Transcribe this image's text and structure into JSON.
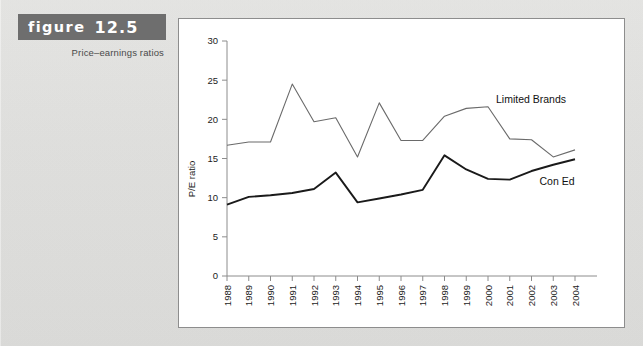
{
  "figure": {
    "label_word": "figure",
    "label_number": "12.5",
    "subtitle": "Price–earnings ratios",
    "banner_color": "#6e6e6e"
  },
  "chart_data": {
    "type": "line",
    "title": "",
    "xlabel": "",
    "ylabel": "P/E ratio",
    "ylim": [
      0,
      30
    ],
    "yticks": [
      0,
      5,
      10,
      15,
      20,
      25,
      30
    ],
    "ytick_labels": [
      "0",
      "5",
      "10",
      "15",
      "20",
      "25",
      "30"
    ],
    "grid": false,
    "legend_position": "inline-right",
    "categories": [
      "1988",
      "1989",
      "1990",
      "1991",
      "1992",
      "1993",
      "1994",
      "1995",
      "1996",
      "1997",
      "1998",
      "1999",
      "2000",
      "2001",
      "2002",
      "2003",
      "2004"
    ],
    "series": [
      {
        "name": "Limited Brands",
        "color": "#6a6a6a",
        "values": [
          16.7,
          17.1,
          17.1,
          24.5,
          19.7,
          20.2,
          15.2,
          22.1,
          17.3,
          17.3,
          20.4,
          21.4,
          21.6,
          17.5,
          17.4,
          15.2,
          16.1
        ]
      },
      {
        "name": "Con Ed",
        "color": "#1a1a1a",
        "values": [
          9.1,
          10.1,
          10.3,
          10.6,
          11.1,
          13.2,
          9.4,
          9.9,
          10.4,
          11.0,
          15.4,
          13.6,
          12.4,
          12.3,
          13.4,
          14.2,
          14.9
        ]
      }
    ],
    "annotations": [
      {
        "text": "Limited Brands",
        "series": "Limited Brands"
      },
      {
        "text": "Con Ed",
        "series": "Con Ed"
      }
    ]
  }
}
